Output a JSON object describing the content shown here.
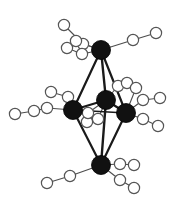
{
  "figure": {
    "kind": "molecular-structure-diagram",
    "width": 183,
    "height": 206,
    "background_color": "#ffffff"
  },
  "style": {
    "metal_fill": "#111111",
    "metal_stroke": "#000000",
    "ligand_fill": "#ffffff",
    "ligand_stroke": "#555555",
    "cluster_bond_color": "#1a1a1a",
    "ligand_bond_color": "#4d4d4d",
    "metal_radius": 9.5,
    "ligand_radius": 5.6,
    "cluster_bond_width": 2.2,
    "ligand_bond_width": 1.1
  },
  "metal_atoms": [
    {
      "id": "M-apex-top",
      "label": "apex top",
      "x": 101,
      "y": 50,
      "r": 9.5
    },
    {
      "id": "M-equator-left",
      "label": "equatorial left",
      "x": 73,
      "y": 110,
      "r": 9.5
    },
    {
      "id": "M-equator-mid",
      "label": "equatorial mid",
      "x": 106,
      "y": 100,
      "r": 9.5
    },
    {
      "id": "M-equator-right",
      "label": "equatorial right",
      "x": 126,
      "y": 113,
      "r": 9.5
    },
    {
      "id": "M-apex-bottom",
      "label": "apex bottom",
      "x": 101,
      "y": 165,
      "r": 9.5
    }
  ],
  "cluster_bonds": [
    {
      "from": "M-apex-top",
      "to": "M-equator-left",
      "x1": 101,
      "y1": 50,
      "x2": 73,
      "y2": 110,
      "w": 2.2
    },
    {
      "from": "M-apex-top",
      "to": "M-equator-mid",
      "x1": 101,
      "y1": 50,
      "x2": 106,
      "y2": 100,
      "w": 2.4
    },
    {
      "from": "M-apex-top",
      "to": "M-equator-right",
      "x1": 101,
      "y1": 50,
      "x2": 126,
      "y2": 113,
      "w": 2.2
    },
    {
      "from": "M-equator-left",
      "to": "M-equator-mid",
      "x1": 73,
      "y1": 110,
      "x2": 106,
      "y2": 100,
      "w": 2.2
    },
    {
      "from": "M-equator-mid",
      "to": "M-equator-right",
      "x1": 106,
      "y1": 100,
      "x2": 126,
      "y2": 113,
      "w": 2.2
    },
    {
      "from": "M-equator-left",
      "to": "M-equator-right",
      "x1": 73,
      "y1": 110,
      "x2": 126,
      "y2": 113,
      "w": 1.6
    },
    {
      "from": "M-apex-bottom",
      "to": "M-equator-left",
      "x1": 101,
      "y1": 165,
      "x2": 73,
      "y2": 110,
      "w": 2.2
    },
    {
      "from": "M-apex-bottom",
      "to": "M-equator-mid",
      "x1": 101,
      "y1": 165,
      "x2": 106,
      "y2": 100,
      "w": 2.4
    },
    {
      "from": "M-apex-bottom",
      "to": "M-equator-right",
      "x1": 101,
      "y1": 165,
      "x2": 126,
      "y2": 113,
      "w": 2.2
    }
  ],
  "ligand_chains": [
    {
      "id": "chain-top-a",
      "attached_to": "M-apex-top",
      "atoms": [
        {
          "x": 83,
          "y": 44,
          "r": 5.6
        },
        {
          "x": 64,
          "y": 25,
          "r": 5.6
        }
      ]
    },
    {
      "id": "chain-top-b",
      "attached_to": "M-apex-top",
      "atoms": [
        {
          "x": 82,
          "y": 54,
          "r": 5.6
        },
        {
          "x": 67,
          "y": 48,
          "r": 5.6
        }
      ]
    },
    {
      "id": "chain-top-c",
      "attached_to": "M-apex-top",
      "atoms": [
        {
          "x": 76,
          "y": 41,
          "r": 5.6
        }
      ]
    },
    {
      "id": "chain-top-right",
      "attached_to": "M-apex-top",
      "atoms": [
        {
          "x": 133,
          "y": 40,
          "r": 5.6
        },
        {
          "x": 156,
          "y": 33,
          "r": 5.6
        }
      ]
    },
    {
      "id": "chain-left-upper",
      "attached_to": "M-equator-left",
      "atoms": [
        {
          "x": 68,
          "y": 97,
          "r": 5.6
        },
        {
          "x": 51,
          "y": 92,
          "r": 5.6
        }
      ]
    },
    {
      "id": "chain-left-lower",
      "attached_to": "M-equator-left",
      "atoms": [
        {
          "x": 47,
          "y": 108,
          "r": 5.6
        },
        {
          "x": 34,
          "y": 111,
          "r": 5.6
        },
        {
          "x": 15,
          "y": 114,
          "r": 5.6
        }
      ]
    },
    {
      "id": "chain-mid-upper",
      "attached_to": "M-equator-mid",
      "atoms": [
        {
          "x": 118,
          "y": 86,
          "r": 5.6
        },
        {
          "x": 127,
          "y": 83,
          "r": 5.6
        }
      ]
    },
    {
      "id": "chain-mid-lower",
      "attached_to": "M-equator-mid",
      "atoms": [
        {
          "x": 98,
          "y": 119,
          "r": 5.6
        },
        {
          "x": 87,
          "y": 122,
          "r": 5.6
        }
      ]
    },
    {
      "id": "chain-mid-lower-b",
      "attached_to": "M-equator-mid",
      "atoms": [
        {
          "x": 88,
          "y": 113,
          "r": 5.6
        }
      ]
    },
    {
      "id": "chain-right-upper",
      "attached_to": "M-equator-right",
      "atoms": [
        {
          "x": 143,
          "y": 100,
          "r": 5.6
        },
        {
          "x": 160,
          "y": 98,
          "r": 5.6
        }
      ]
    },
    {
      "id": "chain-right-lower",
      "attached_to": "M-equator-right",
      "atoms": [
        {
          "x": 143,
          "y": 119,
          "r": 5.6
        },
        {
          "x": 158,
          "y": 126,
          "r": 5.6
        }
      ]
    },
    {
      "id": "chain-right-top",
      "attached_to": "M-equator-right",
      "atoms": [
        {
          "x": 136,
          "y": 88,
          "r": 5.6
        }
      ]
    },
    {
      "id": "chain-bottom-left",
      "attached_to": "M-apex-bottom",
      "atoms": [
        {
          "x": 70,
          "y": 176,
          "r": 5.6
        },
        {
          "x": 47,
          "y": 183,
          "r": 5.6
        }
      ]
    },
    {
      "id": "chain-bottom-right-a",
      "attached_to": "M-apex-bottom",
      "atoms": [
        {
          "x": 120,
          "y": 164,
          "r": 5.6
        },
        {
          "x": 134,
          "y": 165,
          "r": 5.6
        }
      ]
    },
    {
      "id": "chain-bottom-right-b",
      "attached_to": "M-apex-bottom",
      "atoms": [
        {
          "x": 120,
          "y": 180,
          "r": 5.6
        },
        {
          "x": 134,
          "y": 188,
          "r": 5.6
        }
      ]
    }
  ]
}
